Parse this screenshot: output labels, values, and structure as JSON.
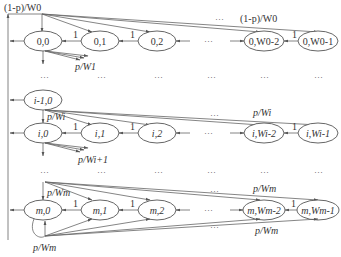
{
  "nodes": {
    "row0": [
      "0,0",
      "0,1",
      "0,2",
      "0,W0-2",
      "0,W0-1"
    ],
    "rowPrev": [
      "i-1,0"
    ],
    "rowi": [
      "i,0",
      "i,1",
      "i,2",
      "i,Wi-2",
      "i,Wi-1"
    ],
    "rowm": [
      "m,0",
      "m,1",
      "m,2",
      "m,Wm-2",
      "m,Wm-1"
    ]
  },
  "labels": {
    "top_left": "(1-p)/W0",
    "top_right": "(1-p)/W0",
    "p_w1": "p/W1",
    "p_wi_top": "p/Wi",
    "p_wi_right": "p/Wi",
    "p_wi1": "p/Wi+1",
    "p_wm_top": "p/Wm",
    "p_wm_right_top": "p/Wm",
    "p_wm_right_bottom": "p/Wm",
    "p_wm_bottom": "p/Wm",
    "one": "1",
    "ellipsis": "···"
  }
}
